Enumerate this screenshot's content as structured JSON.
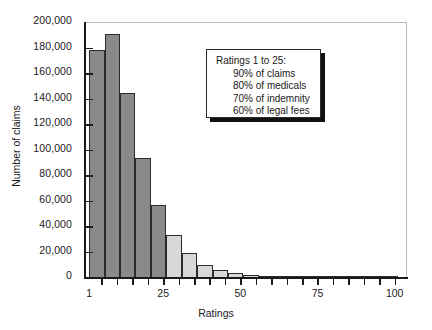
{
  "chart_data": {
    "type": "bar",
    "title": "",
    "xlabel": "Ratings",
    "ylabel": "Number of claims",
    "xlim": [
      0,
      104
    ],
    "ylim": [
      0,
      200000
    ],
    "grid": false,
    "legend": "none",
    "x_ticks": [
      1,
      25,
      50,
      75,
      100
    ],
    "x_tick_labels": [
      "1",
      "25",
      "50",
      "75",
      "100"
    ],
    "y_ticks": [
      0,
      20000,
      40000,
      60000,
      80000,
      100000,
      120000,
      140000,
      160000,
      180000,
      200000
    ],
    "y_tick_labels": [
      "0",
      "20,000",
      "40,000",
      "60,000",
      "80,000",
      "100,000",
      "120,000",
      "140,000",
      "160,000",
      "180,000",
      "200,000"
    ],
    "bin_width": 5,
    "bars": [
      {
        "x_start": 1,
        "x_end": 6,
        "value": 179000,
        "color": "#8a8a8a"
      },
      {
        "x_start": 6,
        "x_end": 11,
        "value": 191000,
        "color": "#8a8a8a"
      },
      {
        "x_start": 11,
        "x_end": 16,
        "value": 145000,
        "color": "#8a8a8a"
      },
      {
        "x_start": 16,
        "x_end": 21,
        "value": 94000,
        "color": "#8a8a8a"
      },
      {
        "x_start": 21,
        "x_end": 26,
        "value": 57000,
        "color": "#8a8a8a"
      },
      {
        "x_start": 26,
        "x_end": 31,
        "value": 34000,
        "color": "#d8d8d8"
      },
      {
        "x_start": 31,
        "x_end": 36,
        "value": 20000,
        "color": "#d8d8d8"
      },
      {
        "x_start": 36,
        "x_end": 41,
        "value": 10000,
        "color": "#d8d8d8"
      },
      {
        "x_start": 41,
        "x_end": 46,
        "value": 6000,
        "color": "#d8d8d8"
      },
      {
        "x_start": 46,
        "x_end": 51,
        "value": 4000,
        "color": "#d8d8d8"
      },
      {
        "x_start": 51,
        "x_end": 56,
        "value": 2500,
        "color": "#d8d8d8"
      },
      {
        "x_start": 56,
        "x_end": 61,
        "value": 1200,
        "color": "#d8d8d8"
      },
      {
        "x_start": 61,
        "x_end": 66,
        "value": 900,
        "color": "#d8d8d8"
      },
      {
        "x_start": 66,
        "x_end": 71,
        "value": 600,
        "color": "#d8d8d8"
      },
      {
        "x_start": 71,
        "x_end": 76,
        "value": 450,
        "color": "#d8d8d8"
      },
      {
        "x_start": 76,
        "x_end": 81,
        "value": 350,
        "color": "#d8d8d8"
      },
      {
        "x_start": 81,
        "x_end": 86,
        "value": 280,
        "color": "#d8d8d8"
      },
      {
        "x_start": 86,
        "x_end": 91,
        "value": 220,
        "color": "#d8d8d8"
      },
      {
        "x_start": 91,
        "x_end": 96,
        "value": 180,
        "color": "#d8d8d8"
      },
      {
        "x_start": 96,
        "x_end": 101,
        "value": 150,
        "color": "#d8d8d8"
      }
    ]
  },
  "annotation": {
    "title": "Ratings 1 to 25:",
    "lines": [
      "90% of claims",
      "80% of medicals",
      "70% of indemnity",
      "60% of legal fees"
    ]
  },
  "colors": {
    "bar_dark": "#8a8a8a",
    "bar_light": "#d8d8d8",
    "bar_edge": "#2b2b2b",
    "axis": "#1a1a1a",
    "frame": "#b9b9b9",
    "background": "#ffffff"
  }
}
